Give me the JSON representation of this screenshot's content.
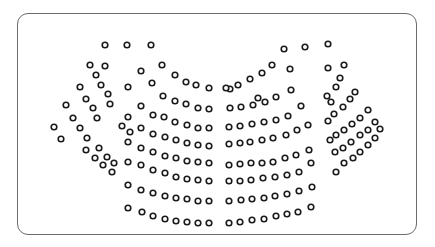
{
  "diagram": {
    "type": "hemicycle-seating",
    "title": "",
    "seat_color": "#1a1a1a",
    "frame_border_color": "#6b6b6b",
    "seat_radius": 2.8,
    "total_seats": 207,
    "seats": [
      [
        105,
        45
      ],
      [
        127,
        45
      ],
      [
        151,
        45
      ],
      [
        90,
        65
      ],
      [
        105,
        66
      ],
      [
        96,
        75
      ],
      [
        80,
        87
      ],
      [
        101,
        85
      ],
      [
        108,
        94
      ],
      [
        66,
        105
      ],
      [
        86,
        99
      ],
      [
        93,
        108
      ],
      [
        54,
        127
      ],
      [
        73,
        118
      ],
      [
        80,
        128
      ],
      [
        61,
        139
      ],
      [
        87,
        138
      ],
      [
        99,
        148
      ],
      [
        107,
        157
      ],
      [
        114,
        163
      ],
      [
        99,
        148
      ],
      [
        80,
        128
      ],
      [
        110,
        104
      ],
      [
        97,
        118
      ],
      [
        122,
        126
      ],
      [
        130,
        132
      ],
      [
        86,
        150
      ],
      [
        95,
        158
      ],
      [
        103,
        165
      ],
      [
        112,
        172
      ],
      [
        141,
        71
      ],
      [
        162,
        65
      ],
      [
        175,
        75
      ],
      [
        186,
        82
      ],
      [
        196,
        85
      ],
      [
        209,
        88
      ],
      [
        128,
        87
      ],
      [
        152,
        83
      ],
      [
        163,
        96
      ],
      [
        175,
        101
      ],
      [
        186,
        104
      ],
      [
        198,
        108
      ],
      [
        209,
        109
      ],
      [
        141,
        106
      ],
      [
        153,
        115
      ],
      [
        164,
        117
      ],
      [
        175,
        122
      ],
      [
        187,
        125
      ],
      [
        198,
        128
      ],
      [
        209,
        128
      ],
      [
        128,
        117
      ],
      [
        141,
        128
      ],
      [
        153,
        134
      ],
      [
        165,
        137
      ],
      [
        176,
        140
      ],
      [
        187,
        143
      ],
      [
        198,
        145
      ],
      [
        209,
        146
      ],
      [
        128,
        142
      ],
      [
        141,
        148
      ],
      [
        153,
        152
      ],
      [
        165,
        156
      ],
      [
        176,
        158
      ],
      [
        187,
        161
      ],
      [
        198,
        162
      ],
      [
        209,
        163
      ],
      [
        128,
        162
      ],
      [
        141,
        165
      ],
      [
        153,
        170
      ],
      [
        165,
        173
      ],
      [
        176,
        177
      ],
      [
        187,
        179
      ],
      [
        198,
        180
      ],
      [
        209,
        181
      ],
      [
        128,
        185
      ],
      [
        141,
        190
      ],
      [
        153,
        193
      ],
      [
        165,
        196
      ],
      [
        176,
        198
      ],
      [
        187,
        199
      ],
      [
        198,
        201
      ],
      [
        209,
        201
      ],
      [
        128,
        208
      ],
      [
        142,
        212
      ],
      [
        153,
        216
      ],
      [
        165,
        219
      ],
      [
        176,
        221
      ],
      [
        187,
        222
      ],
      [
        198,
        223
      ],
      [
        209,
        223
      ],
      [
        284,
        49
      ],
      [
        305,
        47
      ],
      [
        328,
        44
      ],
      [
        272,
        65
      ],
      [
        262,
        73
      ],
      [
        250,
        79
      ],
      [
        238,
        85
      ],
      [
        230,
        89
      ],
      [
        258,
        98
      ],
      [
        226,
        88
      ],
      [
        290,
        69
      ],
      [
        291,
        90
      ],
      [
        276,
        97
      ],
      [
        265,
        102
      ],
      [
        253,
        105
      ],
      [
        241,
        107
      ],
      [
        230,
        108
      ],
      [
        301,
        106
      ],
      [
        288,
        116
      ],
      [
        276,
        120
      ],
      [
        264,
        122
      ],
      [
        252,
        124
      ],
      [
        240,
        126
      ],
      [
        229,
        127
      ],
      [
        308,
        125
      ],
      [
        297,
        130
      ],
      [
        286,
        135
      ],
      [
        273,
        138
      ],
      [
        262,
        140
      ],
      [
        250,
        142
      ],
      [
        240,
        143
      ],
      [
        229,
        144
      ],
      [
        309,
        150
      ],
      [
        296,
        155
      ],
      [
        285,
        158
      ],
      [
        273,
        162
      ],
      [
        262,
        163
      ],
      [
        251,
        163
      ],
      [
        240,
        164
      ],
      [
        229,
        165
      ],
      [
        311,
        163
      ],
      [
        299,
        172
      ],
      [
        287,
        175
      ],
      [
        275,
        177
      ],
      [
        263,
        178
      ],
      [
        251,
        180
      ],
      [
        240,
        181
      ],
      [
        229,
        181
      ],
      [
        312,
        187
      ],
      [
        299,
        191
      ],
      [
        287,
        194
      ],
      [
        275,
        196
      ],
      [
        264,
        198
      ],
      [
        252,
        199
      ],
      [
        241,
        200
      ],
      [
        229,
        201
      ],
      [
        311,
        207
      ],
      [
        298,
        212
      ],
      [
        287,
        214
      ],
      [
        276,
        216
      ],
      [
        264,
        219
      ],
      [
        252,
        220
      ],
      [
        240,
        222
      ],
      [
        229,
        223
      ],
      [
        328,
        68
      ],
      [
        344,
        65
      ],
      [
        340,
        78
      ],
      [
        336,
        87
      ],
      [
        327,
        96
      ],
      [
        331,
        102
      ],
      [
        355,
        92
      ],
      [
        350,
        99
      ],
      [
        343,
        107
      ],
      [
        334,
        114
      ],
      [
        328,
        121
      ],
      [
        368,
        110
      ],
      [
        360,
        118
      ],
      [
        352,
        124
      ],
      [
        344,
        130
      ],
      [
        336,
        135
      ],
      [
        330,
        140
      ],
      [
        375,
        122
      ],
      [
        368,
        130
      ],
      [
        360,
        135
      ],
      [
        351,
        142
      ],
      [
        343,
        148
      ],
      [
        335,
        152
      ],
      [
        380,
        129
      ],
      [
        375,
        138
      ],
      [
        368,
        145
      ],
      [
        360,
        152
      ],
      [
        353,
        158
      ],
      [
        344,
        163
      ],
      [
        336,
        172
      ]
    ]
  }
}
